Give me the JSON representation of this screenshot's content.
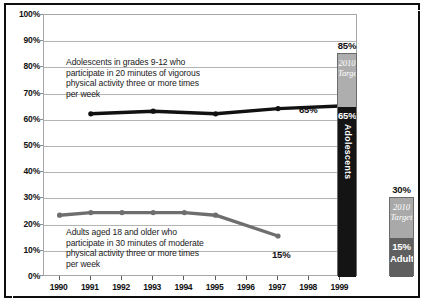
{
  "chart_data": {
    "type": "line",
    "title": "",
    "xlabel": "",
    "ylabel": "",
    "x": [
      1990,
      1991,
      1992,
      1993,
      1994,
      1995,
      1996,
      1997,
      1998,
      1999
    ],
    "xtick_labels": [
      "1990",
      "1991",
      "1992",
      "1993",
      "1994",
      "1995",
      "1996",
      "1997",
      "1998",
      "1999"
    ],
    "ylim": [
      0,
      100
    ],
    "ytick_labels": [
      "0%",
      "10%",
      "20%",
      "30%",
      "40%",
      "50%",
      "60%",
      "70%",
      "80%",
      "90%",
      "100%"
    ],
    "ytick_values": [
      0,
      10,
      20,
      30,
      40,
      50,
      60,
      70,
      80,
      90,
      100
    ],
    "grid": true,
    "legend_position": "none",
    "series": [
      {
        "name": "Adolescents in grades 9-12",
        "color": "#111111",
        "x": [
          1991,
          1993,
          1995,
          1997,
          1999
        ],
        "values": [
          62,
          63,
          62,
          64,
          65
        ],
        "end_label": "65%"
      },
      {
        "name": "Adults aged 18 and older",
        "color": "#6e6e6e",
        "x": [
          1990,
          1991,
          1992,
          1993,
          1994,
          1995,
          1997
        ],
        "values": [
          23,
          24,
          24,
          24,
          24,
          23,
          15
        ],
        "end_label": "15%"
      }
    ],
    "annotations": [
      {
        "id": "adolescents-note",
        "text": "Adolescents in grades 9-12 who\nparticipate in 20 minutes of vigorous\nphysical activity three or more times\nper week"
      },
      {
        "id": "adults-note",
        "text": "Adults aged 18 and older who\nparticipate in 30 minutes of moderate\nphysical activity three or more times\nper week"
      }
    ],
    "target_bars": [
      {
        "id": "adolescents",
        "top_label": "85%",
        "target_value": 85,
        "current_value": 65,
        "current_label": "65%",
        "group_label": "Adolescents",
        "target_label": "2010\nTarget",
        "current_color": "#141414",
        "target_color": "#aeaeae",
        "orientation": "vertical-text"
      },
      {
        "id": "adults",
        "top_label": "30%",
        "target_value": 30,
        "current_value": 15,
        "current_label": "15%",
        "group_label": "Adults",
        "target_label": "2010\nTarget",
        "current_color": "#5f5f5f",
        "target_color": "#a9a9a9",
        "orientation": "horizontal-text"
      }
    ]
  },
  "ytick_labels": {
    "t100": "100%",
    "t90": "90%",
    "t80": "80%",
    "t70": "70%",
    "t60": "60%",
    "t50": "50%",
    "t40": "40%",
    "t30": "30%",
    "t20": "20%",
    "t10": "10%",
    "t0": "0%"
  },
  "xtick_labels": {
    "y1990": "1990",
    "y1991": "1991",
    "y1992": "1992",
    "y1993": "1993",
    "y1994": "1994",
    "y1995": "1995",
    "y1996": "1996",
    "y1997": "1997",
    "y1998": "1998",
    "y1999": "1999"
  },
  "annotations": {
    "adolescents": "Adolescents in grades 9-12 who\nparticipate in 20 minutes of vigorous\nphysical activity three or more times\nper week",
    "adults": "Adults aged 18 and older who\nparticipate in 30 minutes of moderate\nphysical activity three or more times\nper week"
  },
  "point_labels": {
    "adolescents_end": "65%",
    "adults_end": "15%"
  },
  "bars": {
    "adolescents": {
      "top_label": "85%",
      "target_text": "2010\nTarget",
      "value_label": "65%",
      "group_label": "Adolescents"
    },
    "adults": {
      "top_label": "30%",
      "target_text": "2010\nTarget",
      "value_label": "15%",
      "group_label": "Adults"
    }
  },
  "colors": {
    "adolescents_line": "#111111",
    "adults_line": "#6e6e6e",
    "adolescents_bar": "#141414",
    "adolescents_target": "#aeaeae",
    "adults_bar": "#5f5f5f",
    "adults_target": "#a9a9a9",
    "grid": "#b4b4b4",
    "frame": "#0e0e0e"
  }
}
